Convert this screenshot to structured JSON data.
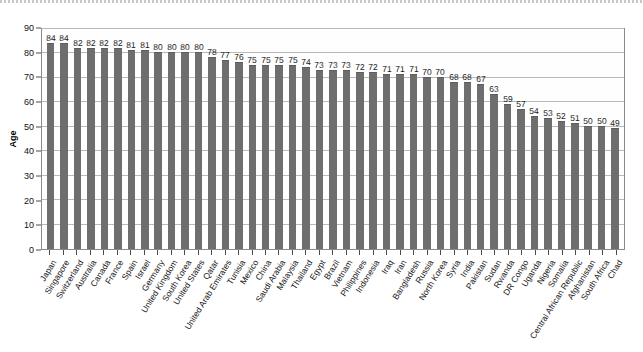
{
  "chart": {
    "ylabel": "Age",
    "ylim": [
      0,
      90
    ],
    "yticks": [
      0,
      10,
      20,
      30,
      40,
      50,
      60,
      70,
      80,
      90
    ],
    "bar_color": "#6e6e6e",
    "grid_color": "#b9b9b9",
    "axis_color": "#8a8a8a"
  },
  "chart_data": {
    "type": "bar",
    "title": "",
    "xlabel": "",
    "ylabel": "Age",
    "ylim": [
      0,
      90
    ],
    "yticks": [
      0,
      10,
      20,
      30,
      40,
      50,
      60,
      70,
      80,
      90
    ],
    "grid": true,
    "legend": false,
    "categories": [
      "Japan",
      "Singapore",
      "Switzerland",
      "Australia",
      "Canada",
      "France",
      "Spain",
      "Israel",
      "Germany",
      "United Kingdom",
      "South Korea",
      "United States",
      "Qatar",
      "United Arab Emirates",
      "Tunisia",
      "Mexico",
      "China",
      "Saudi Arabia",
      "Malaysia",
      "Thailand",
      "Egypt",
      "Brazil",
      "Vietnam",
      "Philippines",
      "Indonesia",
      "Iraq",
      "Iran",
      "Bangladesh",
      "Russia",
      "North Korea",
      "Syria",
      "India",
      "Pakistan",
      "Sudan",
      "Rwanda",
      "DR Congo",
      "Uganda",
      "Nigeria",
      "Somalia",
      "Central African Republic",
      "Afghanistan",
      "South Africa",
      "Chad"
    ],
    "values": [
      84,
      84,
      82,
      82,
      82,
      82,
      81,
      81,
      80,
      80,
      80,
      80,
      78,
      77,
      76,
      75,
      75,
      75,
      75,
      74,
      73,
      73,
      73,
      72,
      72,
      71,
      71,
      71,
      70,
      70,
      68,
      68,
      67,
      63,
      59,
      57,
      54,
      53,
      52,
      51,
      50,
      50,
      49
    ]
  }
}
